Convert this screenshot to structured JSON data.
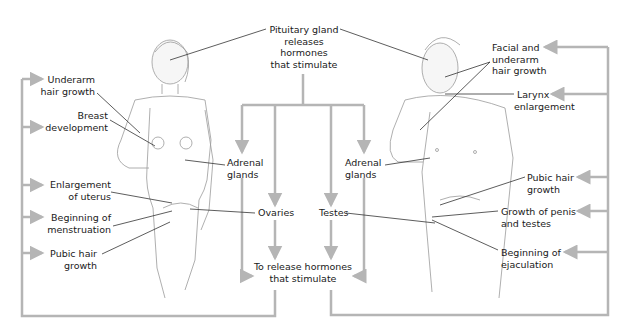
{
  "diagram": {
    "center": {
      "pituitary": [
        "Pituitary gland",
        "releases",
        "hormones",
        "that stimulate"
      ],
      "adrenal_left": [
        "Adrenal",
        "glands"
      ],
      "adrenal_right": [
        "Adrenal",
        "glands"
      ],
      "ovaries": "Ovaries",
      "testes": "Testes",
      "release": [
        "To release hormones",
        "that stimulate"
      ]
    },
    "female": {
      "labels": [
        [
          "Underarm",
          "hair growth"
        ],
        [
          "Breast",
          "development"
        ],
        [
          "Enlargement",
          "of uterus"
        ],
        [
          "Beginning of",
          "menstruation"
        ],
        [
          "Pubic hair",
          "growth"
        ]
      ]
    },
    "male": {
      "labels": [
        [
          "Facial and",
          "underarm",
          "hair growth"
        ],
        [
          "Larynx",
          "enlargement"
        ],
        [
          "Pubic hair",
          "growth"
        ],
        [
          "Growth of penis",
          "and testes"
        ],
        [
          "Beginning of",
          "ejaculation"
        ]
      ]
    },
    "colors": {
      "connector": "#b5b5b5",
      "leader": "#333333",
      "text": "#1a1a1a",
      "figure_line": "#9a9a9a"
    }
  }
}
